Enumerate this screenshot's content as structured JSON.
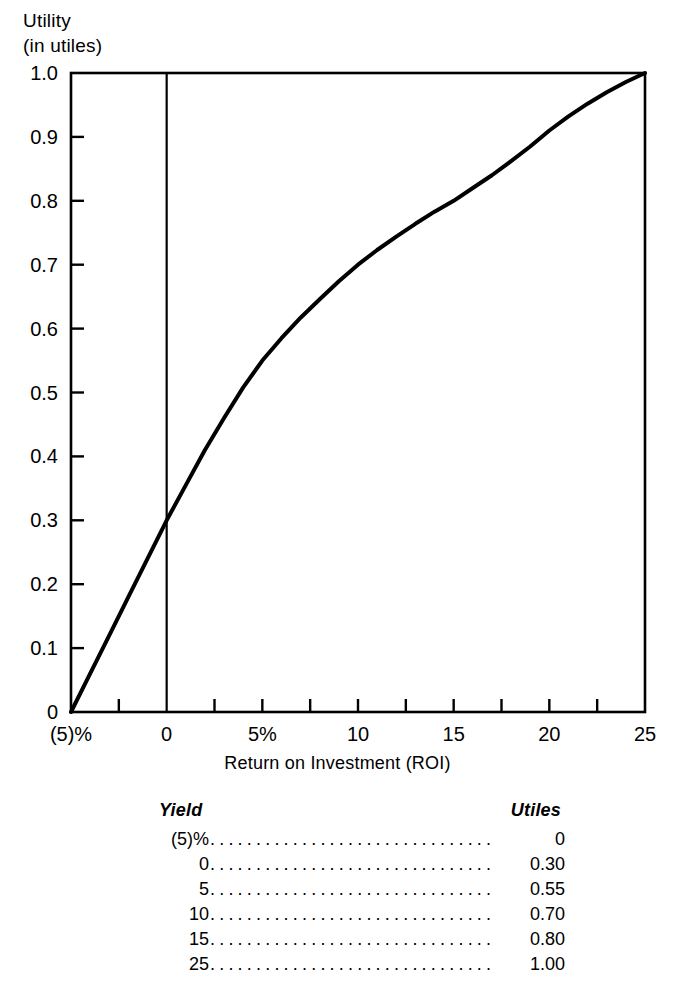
{
  "chart_data": {
    "type": "line",
    "title": "",
    "ylabel_line1": "Utility",
    "ylabel_line2": "(in utiles)",
    "xlabel": "Return on Investment (ROI)",
    "xlim": [
      -5,
      25
    ],
    "ylim": [
      0,
      1.0
    ],
    "grid": false,
    "legend": null,
    "x_tick_labels": [
      {
        "value": -5,
        "label": "(5)%"
      },
      {
        "value": 0,
        "label": "0"
      },
      {
        "value": 5,
        "label": "5%"
      },
      {
        "value": 10,
        "label": "10"
      },
      {
        "value": 15,
        "label": "15"
      },
      {
        "value": 20,
        "label": "20"
      },
      {
        "value": 25,
        "label": "25"
      }
    ],
    "x_minor_ticks": [
      -2.5,
      2.5,
      7.5,
      12.5,
      17.5,
      22.5
    ],
    "y_tick_labels": [
      {
        "value": 0,
        "label": "0"
      },
      {
        "value": 0.1,
        "label": "0.1"
      },
      {
        "value": 0.2,
        "label": "0.2"
      },
      {
        "value": 0.3,
        "label": "0.3"
      },
      {
        "value": 0.4,
        "label": "0.4"
      },
      {
        "value": 0.5,
        "label": "0.5"
      },
      {
        "value": 0.6,
        "label": "0.6"
      },
      {
        "value": 0.7,
        "label": "0.7"
      },
      {
        "value": 0.8,
        "label": "0.8"
      },
      {
        "value": 0.9,
        "label": "0.9"
      },
      {
        "value": 1.0,
        "label": "1.0"
      }
    ],
    "zero_reference_line_x": 0,
    "series": [
      {
        "name": "Utility curve",
        "x": [
          -5,
          -4,
          -3,
          -2,
          -1,
          0,
          1,
          2,
          3,
          4,
          5,
          6,
          7,
          8,
          9,
          10,
          11,
          12,
          13,
          14,
          15,
          16,
          17,
          18,
          19,
          20,
          21,
          22,
          23,
          24,
          25
        ],
        "y": [
          0,
          0.06,
          0.12,
          0.18,
          0.24,
          0.3,
          0.355,
          0.41,
          0.46,
          0.508,
          0.55,
          0.585,
          0.617,
          0.646,
          0.674,
          0.7,
          0.723,
          0.744,
          0.764,
          0.783,
          0.8,
          0.82,
          0.84,
          0.862,
          0.885,
          0.91,
          0.932,
          0.952,
          0.97,
          0.986,
          1.0
        ]
      }
    ],
    "line_color": "#000000",
    "frame_color": "#000000",
    "background": "#ffffff"
  },
  "table": {
    "headers": {
      "yield": "Yield",
      "utiles": "Utiles"
    },
    "leader": "................................................",
    "rows": [
      {
        "yield": "(5)%",
        "utiles": "0"
      },
      {
        "yield": "0",
        "utiles": "0.30"
      },
      {
        "yield": "5",
        "utiles": "0.55"
      },
      {
        "yield": "10",
        "utiles": "0.70"
      },
      {
        "yield": "15",
        "utiles": "0.80"
      },
      {
        "yield": "25",
        "utiles": "1.00"
      }
    ]
  }
}
